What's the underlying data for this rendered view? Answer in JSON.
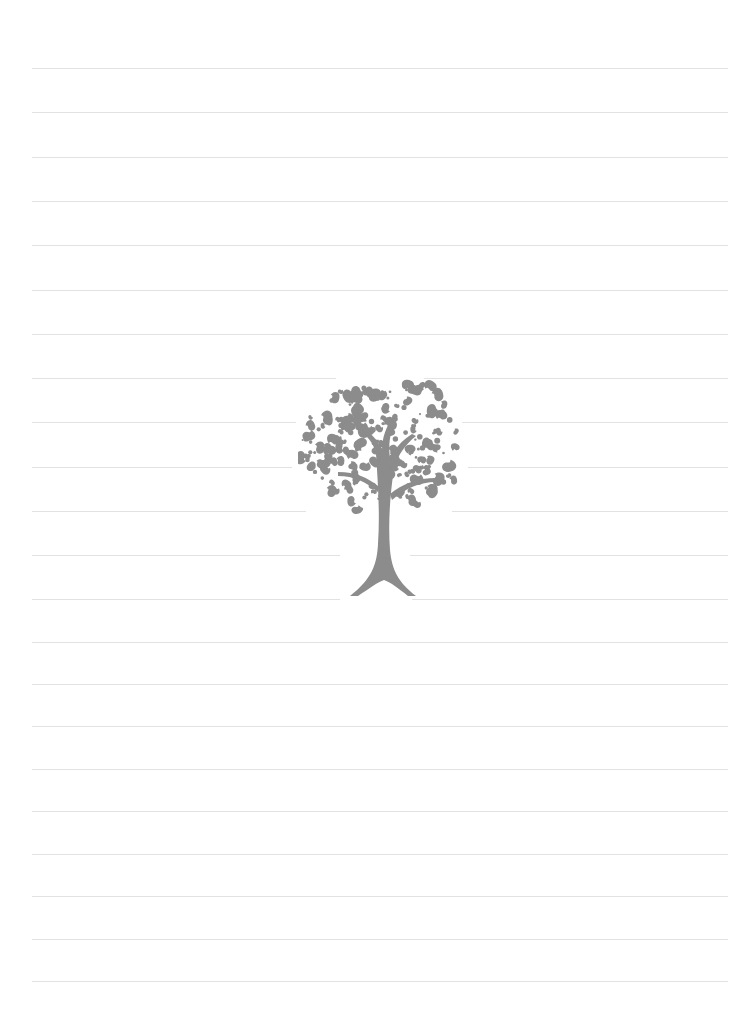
{
  "page": {
    "type": "lined-notebook-page",
    "background_color": "#ffffff",
    "rule_color": "#e2e2e2",
    "rule_left": 32,
    "rule_right": 728,
    "rule_positions_y": [
      68,
      112,
      157,
      201,
      245,
      290,
      334,
      378,
      422,
      467,
      511,
      555,
      599,
      642,
      684,
      726,
      769,
      811,
      854,
      896,
      939,
      981
    ]
  },
  "illustration": {
    "icon": "tree-icon",
    "color": "#8c8c8c",
    "description": "decorative swirling-leaf tree"
  }
}
